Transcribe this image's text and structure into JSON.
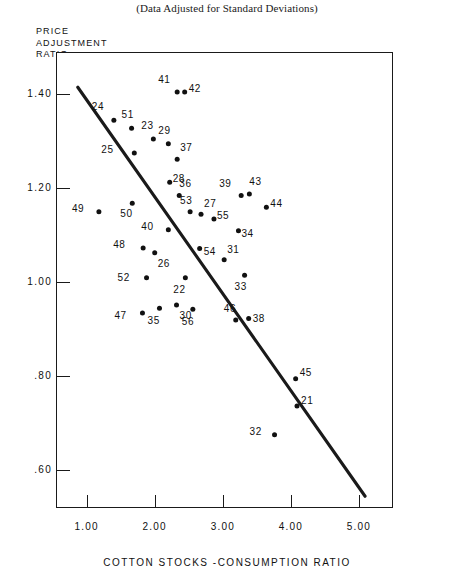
{
  "chart_data": {
    "type": "scatter",
    "title": "(Data Adjusted for Standard Deviations)",
    "xlabel": "COTTON STOCKS -CONSUMPTION RATIO",
    "ylabel": "PRICE ADJUSTMENT RATIO",
    "ylabel_lines": [
      "PRICE",
      "ADJUSTMENT",
      "RATIO"
    ],
    "xlim": [
      0.55,
      5.5
    ],
    "ylim": [
      0.52,
      1.49
    ],
    "grid": false,
    "legend": null,
    "xticks": [
      {
        "value": 1.0,
        "label": "1.00"
      },
      {
        "value": 2.0,
        "label": "2.00"
      },
      {
        "value": 3.0,
        "label": "3.00"
      },
      {
        "value": 4.0,
        "label": "4.00"
      },
      {
        "value": 5.0,
        "label": "5.00"
      }
    ],
    "yticks": [
      {
        "value": 1.4,
        "label": "1.40"
      },
      {
        "value": 1.2,
        "label": "1.20"
      },
      {
        "value": 1.0,
        "label": "1.00"
      },
      {
        "value": 0.8,
        "label": ".80"
      },
      {
        "value": 0.6,
        "label": ".60"
      }
    ],
    "trendline": {
      "x": [
        0.87,
        5.09
      ],
      "y": [
        1.415,
        0.545
      ]
    },
    "points": [
      {
        "label": "24",
        "x": 1.4,
        "y": 1.345,
        "lx": -14,
        "ly": -13
      },
      {
        "label": "51",
        "x": 1.66,
        "y": 1.328,
        "lx": -2,
        "ly": -13
      },
      {
        "label": "25",
        "x": 1.7,
        "y": 1.275,
        "lx": -25,
        "ly": -3
      },
      {
        "label": "23",
        "x": 1.98,
        "y": 1.305,
        "lx": -4,
        "ly": -13
      },
      {
        "label": "29",
        "x": 2.2,
        "y": 1.295,
        "lx": -2,
        "ly": -13
      },
      {
        "label": "37",
        "x": 2.33,
        "y": 1.262,
        "lx": 3,
        "ly": -11
      },
      {
        "label": "41",
        "x": 2.33,
        "y": 1.405,
        "lx": -11,
        "ly": -12
      },
      {
        "label": "42",
        "x": 2.44,
        "y": 1.405,
        "lx": 4,
        "ly": -3
      },
      {
        "label": "28",
        "x": 2.22,
        "y": 1.213,
        "lx": 3,
        "ly": -3
      },
      {
        "label": "36",
        "x": 2.36,
        "y": 1.185,
        "lx": 0,
        "ly": -11
      },
      {
        "label": "49",
        "x": 1.18,
        "y": 1.15,
        "lx": -19,
        "ly": -3
      },
      {
        "label": "50",
        "x": 1.67,
        "y": 1.168,
        "lx": -4,
        "ly": 11
      },
      {
        "label": "53",
        "x": 2.52,
        "y": 1.15,
        "lx": -2,
        "ly": -11
      },
      {
        "label": "27",
        "x": 2.68,
        "y": 1.145,
        "lx": 3,
        "ly": -10
      },
      {
        "label": "55",
        "x": 2.87,
        "y": 1.135,
        "lx": 3,
        "ly": -3
      },
      {
        "label": "40",
        "x": 2.2,
        "y": 1.112,
        "lx": -19,
        "ly": -3
      },
      {
        "label": "48",
        "x": 1.83,
        "y": 1.073,
        "lx": -22,
        "ly": -3
      },
      {
        "label": "26",
        "x": 2.0,
        "y": 1.063,
        "lx": 3,
        "ly": 11
      },
      {
        "label": "54",
        "x": 2.66,
        "y": 1.072,
        "lx": 4,
        "ly": 3
      },
      {
        "label": "31",
        "x": 3.02,
        "y": 1.048,
        "lx": 3,
        "ly": -10
      },
      {
        "label": "34",
        "x": 3.23,
        "y": 1.11,
        "lx": 3,
        "ly": 3
      },
      {
        "label": "39",
        "x": 3.27,
        "y": 1.185,
        "lx": -14,
        "ly": -11
      },
      {
        "label": "43",
        "x": 3.39,
        "y": 1.188,
        "lx": 0,
        "ly": -12
      },
      {
        "label": "44",
        "x": 3.64,
        "y": 1.16,
        "lx": 4,
        "ly": -3
      },
      {
        "label": "33",
        "x": 3.32,
        "y": 1.015,
        "lx": -2,
        "ly": 12
      },
      {
        "label": "52",
        "x": 1.88,
        "y": 1.01,
        "lx": -21,
        "ly": 0
      },
      {
        "label": "22",
        "x": 2.45,
        "y": 1.01,
        "lx": -4,
        "ly": 12
      },
      {
        "label": "47",
        "x": 1.82,
        "y": 0.935,
        "lx": -20,
        "ly": 3
      },
      {
        "label": "35",
        "x": 2.07,
        "y": 0.945,
        "lx": -4,
        "ly": 13
      },
      {
        "label": "30",
        "x": 2.32,
        "y": 0.952,
        "lx": 3,
        "ly": 11
      },
      {
        "label": "56",
        "x": 2.56,
        "y": 0.943,
        "lx": -3,
        "ly": 13
      },
      {
        "label": "46",
        "x": 3.19,
        "y": 0.92,
        "lx": -4,
        "ly": -11
      },
      {
        "label": "38",
        "x": 3.38,
        "y": 0.923,
        "lx": 4,
        "ly": 0
      },
      {
        "label": "45",
        "x": 4.07,
        "y": 0.795,
        "lx": 4,
        "ly": -6
      },
      {
        "label": "21",
        "x": 4.09,
        "y": 0.737,
        "lx": 4,
        "ly": -5
      },
      {
        "label": "32",
        "x": 3.76,
        "y": 0.676,
        "lx": -17,
        "ly": -3
      }
    ]
  }
}
